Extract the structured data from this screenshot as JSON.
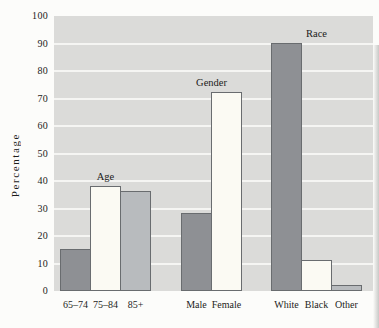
{
  "figure": {
    "plot_background": "#dbdbd9",
    "gridline_color": "#f5f5f3",
    "text_color": "#1c1c1a"
  },
  "chart_data": {
    "type": "bar",
    "title": "",
    "xlabel": "",
    "ylabel": "Percentage",
    "ylim": [
      0,
      100
    ],
    "ytick_interval": 10,
    "yticks": [
      0,
      10,
      20,
      30,
      40,
      50,
      60,
      70,
      80,
      90,
      100
    ],
    "grid": true,
    "legend": "none",
    "groups": [
      {
        "label": "Age",
        "categories": [
          "65–74",
          "75–84",
          "85+"
        ],
        "values": [
          15,
          38,
          36
        ]
      },
      {
        "label": "Gender",
        "categories": [
          "Male",
          "Female"
        ],
        "values": [
          28,
          72
        ]
      },
      {
        "label": "Race",
        "categories": [
          "White",
          "Black",
          "Other"
        ],
        "values": [
          90,
          11,
          2
        ]
      }
    ],
    "bar_fill_sequence": [
      "#8e9094",
      "#fbfaf3",
      "#b8bbbe"
    ],
    "bar_border_color": "#696c6f",
    "layout": {
      "px_per_unit": 2.75,
      "bar_width_px": 30,
      "group_starts_px": [
        6,
        127,
        217
      ]
    }
  }
}
